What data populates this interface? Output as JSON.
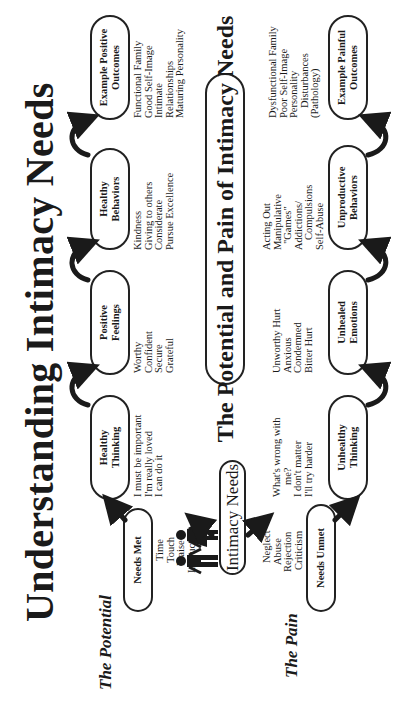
{
  "title": "Understanding Intimacy Needs",
  "center_title": "The Potential and Pain of Intimacy Needs",
  "root": {
    "label": "Intimacy Needs",
    "icon": "man-and-woman-icon"
  },
  "potential": {
    "section_label": "The Potential",
    "needs_met": {
      "label": "Needs Met",
      "items": [
        "Time",
        "Touch",
        "Praise",
        "Instruction"
      ]
    },
    "stages": [
      {
        "label_lines": [
          "Healthy",
          "Thinking"
        ],
        "items": [
          "I must be important",
          "I'm really loved",
          "I can do it"
        ]
      },
      {
        "label_lines": [
          "Positive",
          "Feelings"
        ],
        "items": [
          "Worthy",
          "Confident",
          "Secure",
          "Grateful"
        ]
      },
      {
        "label_lines": [
          "Healthy",
          "Behaviors"
        ],
        "items": [
          "Kindness",
          "Giving to others",
          "Considerate",
          "Pursue Excellence"
        ]
      },
      {
        "label_lines": [
          "Example Positive",
          "Outcomes"
        ],
        "items": [
          "Functional Family",
          "Good Self-Image",
          "Intimate",
          "Relationships",
          "Maturing Personality"
        ]
      }
    ]
  },
  "pain": {
    "section_label": "The Pain",
    "needs_unmet": {
      "label": "Needs Unmet",
      "items": [
        "Neglect",
        "Abuse",
        "Rejection",
        "Criticism"
      ]
    },
    "stages": [
      {
        "label_lines": [
          "Unhealthy",
          "Thinking"
        ],
        "items": [
          "What's wrong with",
          "me?",
          "I don't matter",
          "I'll try harder"
        ]
      },
      {
        "label_lines": [
          "Unhealed",
          "Emotions"
        ],
        "items": [
          "Unworthy Hurt",
          "Anxious",
          "Condemned",
          "Bitter Hurt"
        ]
      },
      {
        "label_lines": [
          "Unproductive",
          "Behaviors"
        ],
        "items": [
          "Acting Out",
          "Manipulative",
          "\"Games\"",
          "Addictions/",
          "Compulsions",
          "Self-Abuse"
        ]
      },
      {
        "label_lines": [
          "Example Painful",
          "Outcomes"
        ],
        "items": [
          "Dysfunctional Family",
          "Poor Self-Image",
          "Personality",
          "Disturbances",
          "(Pathology)"
        ]
      }
    ]
  },
  "colors": {
    "ink": "#1a1a1a",
    "background": "#ffffff"
  }
}
